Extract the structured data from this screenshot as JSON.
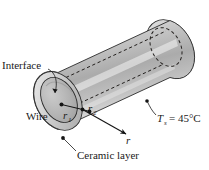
{
  "figure": {
    "type": "engineering-diagram",
    "background_color": "#ffffff",
    "outline_color": "#2b2b2b"
  },
  "labels": {
    "interface": "Interface",
    "wire": "Wire",
    "ceramic_layer": "Ceramic layer",
    "radius_inner_symbol": "r",
    "radius_inner_sub": "1",
    "radius_outer_symbol": "r",
    "radius_outer_sub": "2",
    "radial_axis": "r",
    "surface_temp_symbol": "T",
    "surface_temp_sub": "s",
    "surface_temp_value": "= 45°C"
  },
  "geometry": {
    "cylinder_fill_light": "#f2f2f2",
    "cylinder_fill_mid": "#b9b9b9",
    "cylinder_fill_dark": "#8e8e8e",
    "endcap_ring_fill": "#cfcfcf",
    "endcap_bore_fill": "#b3b3b3"
  }
}
